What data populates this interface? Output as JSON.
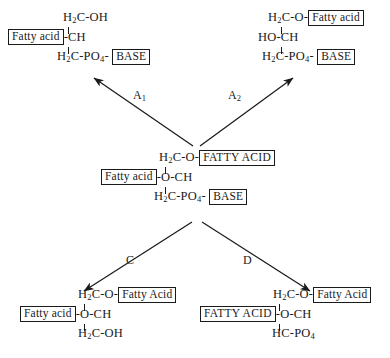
{
  "figure": {
    "line_color": "#1a1a1a",
    "background": "#ffffff"
  },
  "arrow_labels": {
    "a1": {
      "base": "A",
      "sub": "1"
    },
    "a2": {
      "base": "A",
      "sub": "2"
    },
    "c": {
      "base": "C",
      "sub": ""
    },
    "d": {
      "base": "D",
      "sub": ""
    }
  },
  "structures": {
    "center": {
      "name": "parent-phospholipid",
      "row1": {
        "prefix_h": "H",
        "prefix_sub": "2",
        "prefix_rest": "C-O-",
        "box": "FATTY ACID"
      },
      "row2": {
        "box": "Fatty acid",
        "text": "-O-CH"
      },
      "row3": {
        "prefix_h": "H",
        "prefix_sub": "2",
        "prefix_rest": "C-PO",
        "po_sub": "4",
        "dash": "-",
        "box": "BASE"
      }
    },
    "top_left": {
      "name": "product-a1",
      "row1": {
        "prefix_h": "H",
        "prefix_sub": "2",
        "prefix_rest": "C-OH",
        "box": ""
      },
      "row2": {
        "box": "Fatty acid",
        "text": "-CH"
      },
      "row3": {
        "prefix_h": "H",
        "prefix_sub": "2",
        "prefix_rest": "C-PO",
        "po_sub": "4",
        "dash": "-",
        "box": "BASE"
      }
    },
    "top_right": {
      "name": "product-a2",
      "row1": {
        "prefix_h": "H",
        "prefix_sub": "2",
        "prefix_rest": "C-O-",
        "box": "Fatty acid"
      },
      "row2": {
        "box": "",
        "text": "HO-CH"
      },
      "row3": {
        "prefix_h": "H",
        "prefix_sub": "2",
        "prefix_rest": "C-PO",
        "po_sub": "4",
        "dash": "-",
        "box": "BASE"
      }
    },
    "bottom_left": {
      "name": "product-c",
      "row1": {
        "prefix_h": "H",
        "prefix_sub": "2",
        "prefix_rest": "C-O-",
        "box": "Fatty Acid"
      },
      "row2": {
        "box": "Fatty acid",
        "text": "-O-CH"
      },
      "row3": {
        "prefix_h": "H",
        "prefix_sub": "2",
        "prefix_rest": "C-OH",
        "po_sub": "",
        "dash": "",
        "box": ""
      }
    },
    "bottom_right": {
      "name": "product-d",
      "row1": {
        "prefix_h": "H",
        "prefix_sub": "2",
        "prefix_rest": "C-O-",
        "box": "Fatty Acid"
      },
      "row2": {
        "box": "FATTY ACID",
        "text": "-O-CH"
      },
      "row3": {
        "prefix_h": "H",
        "prefix_sub": "",
        "prefix_rest": "C-PO",
        "po_sub": "4",
        "dash": "",
        "box": ""
      }
    }
  }
}
